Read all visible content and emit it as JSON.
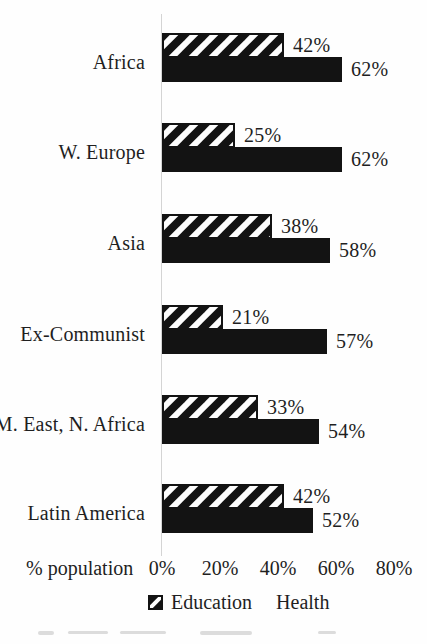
{
  "chart_data": {
    "type": "bar",
    "orientation": "horizontal",
    "title": "",
    "categories": [
      "Africa",
      "W. Europe",
      "Asia",
      "Ex-Communist",
      "M. East, N. Africa",
      "Latin America"
    ],
    "series": [
      {
        "name": "Education",
        "style": "diagonal-hatch",
        "values": [
          42,
          25,
          38,
          21,
          33,
          42
        ]
      },
      {
        "name": "Health",
        "style": "solid-black",
        "values": [
          62,
          62,
          58,
          57,
          54,
          52
        ]
      }
    ],
    "value_label_format": "{v}%",
    "xlabel": "% population",
    "x_ticks": [
      "0%",
      "20%",
      "40%",
      "60%",
      "80%"
    ],
    "x_tick_values": [
      0,
      20,
      40,
      60,
      80
    ],
    "xlim": [
      0,
      80
    ],
    "grid": false,
    "legend_position": "bottom"
  },
  "legend": {
    "items": [
      {
        "label": "Education",
        "swatch": "hatched-square"
      },
      {
        "label": "Health",
        "swatch": "solid-black-square"
      }
    ]
  },
  "colors": {
    "bar_black": "#131313",
    "hatch_stroke": "#131313",
    "hatch_background": "#fdfdfd",
    "text": "#1f1f1f",
    "axis_line": "#d4d4d4",
    "background": "#fefefe"
  }
}
